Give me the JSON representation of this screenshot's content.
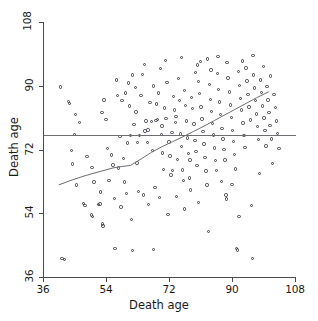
{
  "chart_data": {
    "type": "scatter",
    "title": "",
    "xlabel": "Death age",
    "ylabel": "Death age",
    "xlim": [
      36,
      108
    ],
    "ylim": [
      36,
      108
    ],
    "xticks": [
      36,
      54,
      72,
      90,
      108
    ],
    "yticks": [
      36,
      54,
      72,
      90,
      108
    ],
    "xticklabels": [
      "36",
      "54",
      "72",
      "90",
      "108"
    ],
    "yticklabels": [
      "36",
      "54",
      "72",
      "90",
      "108"
    ],
    "grid": false,
    "legend": null,
    "marker": "open-circle",
    "marker_color": "#3d3d46",
    "line_color": "#6e6e72",
    "background": "#ffffff",
    "annotations": [
      {
        "type": "hline",
        "y": 76.2,
        "label": "reference mean line",
        "color": "#6e6e72"
      },
      {
        "type": "smoother",
        "label": "lowess trend",
        "color": "#6e6e72"
      }
    ],
    "smoother": {
      "x": [
        40.5,
        44.0,
        48.0,
        52.0,
        56.0,
        58.5,
        61.0,
        64.0,
        67.0,
        70.0,
        73.0,
        76.0,
        79.0,
        82.0,
        85.0,
        88.0,
        91.0,
        94.0,
        97.0,
        100.5
      ],
      "y": [
        62.0,
        63.3,
        64.6,
        65.7,
        66.8,
        67.2,
        67.5,
        69.3,
        71.2,
        72.8,
        74.2,
        75.6,
        77.1,
        78.6,
        80.2,
        81.8,
        83.4,
        85.0,
        86.6,
        88.3
      ]
    },
    "points": [
      [
        41.0,
        89.6
      ],
      [
        41.4,
        41.3
      ],
      [
        42.1,
        41.0
      ],
      [
        43.3,
        85.5
      ],
      [
        43.6,
        85.0
      ],
      [
        44.2,
        71.7
      ],
      [
        44.4,
        67.9
      ],
      [
        45.3,
        81.9
      ],
      [
        45.6,
        62.0
      ],
      [
        47.6,
        56.8
      ],
      [
        48.0,
        56.2
      ],
      [
        48.6,
        70.0
      ],
      [
        49.9,
        53.5
      ],
      [
        50.2,
        53.1
      ],
      [
        50.6,
        62.8
      ],
      [
        51.9,
        56.4
      ],
      [
        52.3,
        56.6
      ],
      [
        52.5,
        60.0
      ],
      [
        52.9,
        82.4
      ],
      [
        53.0,
        51.0
      ],
      [
        53.1,
        50.4
      ],
      [
        53.4,
        86.0
      ],
      [
        54.0,
        80.4
      ],
      [
        54.9,
        63.3
      ],
      [
        55.5,
        70.5
      ],
      [
        56.0,
        67.6
      ],
      [
        56.4,
        58.2
      ],
      [
        56.6,
        44.0
      ],
      [
        57.3,
        87.3
      ],
      [
        57.6,
        66.8
      ],
      [
        58.3,
        55.8
      ],
      [
        58.6,
        85.8
      ],
      [
        59.0,
        69.4
      ],
      [
        59.2,
        62.8
      ],
      [
        59.9,
        59.5
      ],
      [
        60.2,
        73.8
      ],
      [
        60.4,
        90.8
      ],
      [
        60.7,
        84.3
      ],
      [
        61.0,
        76.0
      ],
      [
        61.3,
        52.3
      ],
      [
        61.6,
        43.5
      ],
      [
        62.0,
        79.0
      ],
      [
        62.6,
        82.6
      ],
      [
        62.9,
        68.2
      ],
      [
        63.2,
        60.1
      ],
      [
        63.6,
        75.9
      ],
      [
        64.0,
        87.2
      ],
      [
        64.4,
        93.2
      ],
      [
        64.8,
        59.2
      ],
      [
        65.1,
        77.2
      ],
      [
        65.4,
        80.0
      ],
      [
        65.8,
        74.0
      ],
      [
        66.2,
        56.5
      ],
      [
        66.6,
        85.3
      ],
      [
        67.0,
        79.9
      ],
      [
        67.3,
        71.8
      ],
      [
        67.6,
        43.8
      ],
      [
        68.0,
        61.2
      ],
      [
        68.3,
        80.2
      ],
      [
        68.7,
        80.5
      ],
      [
        69.0,
        88.0
      ],
      [
        69.2,
        58.4
      ],
      [
        69.5,
        94.8
      ],
      [
        69.9,
        76.3
      ],
      [
        70.2,
        71.0
      ],
      [
        70.5,
        66.3
      ],
      [
        70.8,
        83.7
      ],
      [
        71.1,
        80.8
      ],
      [
        71.4,
        91.0
      ],
      [
        71.7,
        53.7
      ],
      [
        72.0,
        74.1
      ],
      [
        72.3,
        70.2
      ],
      [
        72.6,
        64.8
      ],
      [
        72.9,
        76.8
      ],
      [
        73.2,
        87.0
      ],
      [
        73.5,
        83.1
      ],
      [
        73.8,
        79.7
      ],
      [
        74.1,
        58.8
      ],
      [
        74.4,
        69.2
      ],
      [
        74.7,
        92.0
      ],
      [
        75.0,
        85.9
      ],
      [
        75.2,
        76.4
      ],
      [
        75.5,
        72.9
      ],
      [
        75.8,
        66.2
      ],
      [
        76.1,
        63.3
      ],
      [
        76.4,
        88.6
      ],
      [
        76.7,
        84.5
      ],
      [
        77.0,
        80.0
      ],
      [
        77.3,
        75.2
      ],
      [
        77.6,
        70.9
      ],
      [
        77.9,
        64.0
      ],
      [
        78.2,
        60.6
      ],
      [
        78.5,
        86.7
      ],
      [
        78.8,
        83.5
      ],
      [
        79.1,
        79.2
      ],
      [
        79.4,
        74.6
      ],
      [
        79.7,
        71.5
      ],
      [
        80.0,
        67.4
      ],
      [
        80.2,
        95.9
      ],
      [
        80.5,
        91.2
      ],
      [
        80.8,
        87.8
      ],
      [
        81.1,
        84.0
      ],
      [
        81.4,
        80.6
      ],
      [
        81.7,
        77.0
      ],
      [
        82.0,
        73.5
      ],
      [
        82.3,
        69.8
      ],
      [
        82.6,
        65.9
      ],
      [
        82.9,
        62.0
      ],
      [
        83.2,
        48.8
      ],
      [
        83.5,
        90.4
      ],
      [
        83.8,
        86.2
      ],
      [
        84.1,
        82.8
      ],
      [
        84.4,
        79.3
      ],
      [
        84.7,
        76.1
      ],
      [
        85.0,
        72.4
      ],
      [
        85.3,
        68.9
      ],
      [
        85.6,
        66.0
      ],
      [
        85.9,
        93.5
      ],
      [
        86.2,
        89.0
      ],
      [
        86.5,
        85.4
      ],
      [
        86.8,
        81.9
      ],
      [
        87.1,
        78.0
      ],
      [
        87.4,
        75.0
      ],
      [
        87.7,
        72.0
      ],
      [
        88.0,
        69.0
      ],
      [
        88.3,
        59.1
      ],
      [
        88.6,
        96.5
      ],
      [
        88.9,
        92.2
      ],
      [
        89.2,
        88.2
      ],
      [
        89.5,
        84.6
      ],
      [
        89.8,
        81.0
      ],
      [
        90.1,
        77.4
      ],
      [
        90.4,
        74.3
      ],
      [
        90.7,
        70.6
      ],
      [
        91.0,
        66.5
      ],
      [
        91.3,
        44.0
      ],
      [
        91.6,
        43.6
      ],
      [
        91.9,
        94.0
      ],
      [
        92.2,
        90.0
      ],
      [
        92.5,
        86.4
      ],
      [
        92.8,
        83.2
      ],
      [
        93.1,
        79.5
      ],
      [
        93.4,
        76.0
      ],
      [
        93.7,
        72.6
      ],
      [
        94.0,
        95.0
      ],
      [
        94.3,
        91.3
      ],
      [
        94.6,
        87.5
      ],
      [
        94.9,
        84.0
      ],
      [
        95.2,
        80.3
      ],
      [
        95.5,
        56.2
      ],
      [
        95.8,
        41.2
      ],
      [
        96.1,
        93.0
      ],
      [
        96.4,
        89.4
      ],
      [
        96.7,
        85.8
      ],
      [
        97.0,
        82.0
      ],
      [
        97.3,
        78.5
      ],
      [
        97.6,
        74.8
      ],
      [
        97.9,
        65.2
      ],
      [
        98.2,
        91.6
      ],
      [
        98.5,
        88.1
      ],
      [
        98.8,
        84.3
      ],
      [
        99.1,
        80.9
      ],
      [
        99.4,
        77.3
      ],
      [
        99.7,
        73.0
      ],
      [
        100.0,
        89.8
      ],
      [
        100.3,
        86.0
      ],
      [
        100.6,
        82.4
      ],
      [
        100.9,
        78.8
      ],
      [
        101.2,
        75.0
      ],
      [
        101.5,
        68.0
      ],
      [
        102.0,
        87.5
      ],
      [
        102.4,
        83.9
      ],
      [
        102.8,
        80.1
      ],
      [
        103.0,
        76.5
      ],
      [
        103.4,
        72.2
      ],
      [
        58.0,
        75.6
      ],
      [
        63.0,
        73.9
      ],
      [
        66.0,
        77.5
      ],
      [
        70.0,
        78.6
      ],
      [
        74.0,
        81.4
      ],
      [
        78.0,
        69.0
      ],
      [
        81.0,
        96.8
      ],
      [
        84.0,
        94.4
      ],
      [
        87.0,
        63.0
      ],
      [
        90.0,
        62.2
      ],
      [
        46.5,
        79.7
      ],
      [
        50.0,
        67.0
      ],
      [
        54.5,
        72.3
      ],
      [
        59.5,
        87.9
      ],
      [
        62.5,
        89.5
      ],
      [
        67.5,
        89.9
      ],
      [
        71.0,
        97.2
      ],
      [
        75.5,
        98.0
      ],
      [
        79.5,
        93.8
      ],
      [
        83.0,
        97.5
      ],
      [
        86.0,
        98.3
      ],
      [
        93.0,
        97.0
      ],
      [
        96.0,
        98.6
      ],
      [
        99.0,
        95.5
      ],
      [
        101.0,
        92.8
      ],
      [
        45.0,
        76.3
      ],
      [
        57.0,
        91.6
      ],
      [
        61.5,
        93.0
      ],
      [
        65.0,
        96.0
      ],
      [
        68.5,
        84.8
      ],
      [
        73.0,
        66.0
      ],
      [
        76.5,
        55.2
      ],
      [
        80.5,
        57.0
      ],
      [
        88.5,
        58.0
      ],
      [
        92.0,
        53.0
      ]
    ]
  }
}
